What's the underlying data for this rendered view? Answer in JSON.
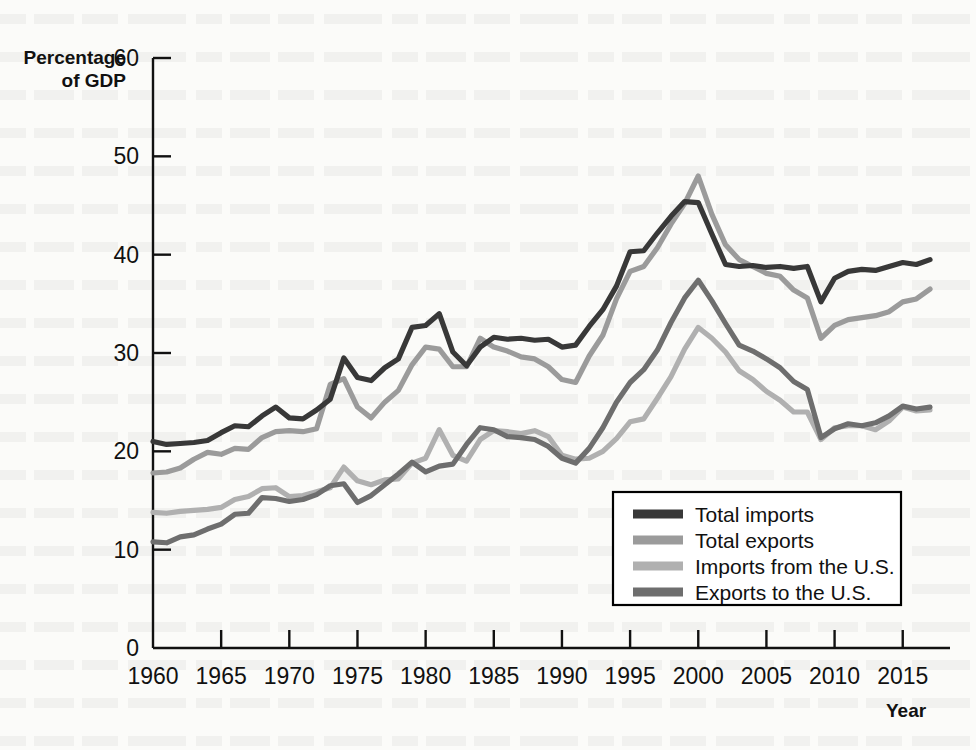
{
  "axes": {
    "y_title_line1": "Percentage",
    "y_title_line2": "of GDP",
    "x_title": "Year",
    "y_ticks": [
      "0",
      "10",
      "20",
      "30",
      "40",
      "50",
      "60"
    ],
    "x_ticks": [
      "1960",
      "1965",
      "1970",
      "1975",
      "1980",
      "1985",
      "1990",
      "1995",
      "2000",
      "2005",
      "2010",
      "2015"
    ]
  },
  "legend": {
    "items": [
      {
        "label": "Total imports",
        "color": "#383838"
      },
      {
        "label": "Total exports",
        "color": "#9b9b9b"
      },
      {
        "label": "Imports from the U.S.",
        "color": "#b0b0b0"
      },
      {
        "label": "Exports to the U.S.",
        "color": "#6e6e6e"
      }
    ]
  },
  "chart_data": {
    "type": "line",
    "title": "",
    "xlabel": "Year",
    "ylabel": "Percentage of GDP",
    "xlim": [
      1960,
      2017
    ],
    "ylim": [
      0,
      60
    ],
    "grid": false,
    "legend_position": "inside-bottom-right",
    "x": [
      1960,
      1961,
      1962,
      1963,
      1964,
      1965,
      1966,
      1967,
      1968,
      1969,
      1970,
      1971,
      1972,
      1973,
      1974,
      1975,
      1976,
      1977,
      1978,
      1979,
      1980,
      1981,
      1982,
      1983,
      1984,
      1985,
      1986,
      1987,
      1988,
      1989,
      1990,
      1991,
      1992,
      1993,
      1994,
      1995,
      1996,
      1997,
      1998,
      1999,
      2000,
      2001,
      2002,
      2003,
      2004,
      2005,
      2006,
      2007,
      2008,
      2009,
      2010,
      2011,
      2012,
      2013,
      2014,
      2015,
      2016,
      2017
    ],
    "series": [
      {
        "name": "Total imports",
        "color": "#383838",
        "values": [
          21.0,
          20.7,
          20.8,
          20.9,
          21.1,
          21.9,
          22.6,
          22.5,
          23.6,
          24.5,
          23.4,
          23.3,
          24.2,
          25.3,
          29.5,
          27.5,
          27.2,
          28.5,
          29.4,
          32.6,
          32.8,
          34.0,
          30.1,
          28.7,
          30.6,
          31.6,
          31.4,
          31.5,
          31.3,
          31.4,
          30.6,
          30.8,
          32.7,
          34.4,
          36.8,
          40.3,
          40.4,
          42.2,
          43.9,
          45.4,
          45.3,
          42.1,
          39.0,
          38.8,
          38.9,
          38.7,
          38.8,
          38.6,
          38.8,
          35.2,
          37.6,
          38.3,
          38.5,
          38.4,
          38.8,
          39.2,
          39.0,
          39.5
        ]
      },
      {
        "name": "Total exports",
        "color": "#9b9b9b",
        "values": [
          17.8,
          17.9,
          18.3,
          19.2,
          19.9,
          19.7,
          20.3,
          20.2,
          21.4,
          22.0,
          22.1,
          22.0,
          22.3,
          26.8,
          27.4,
          24.5,
          23.4,
          25.0,
          26.2,
          28.8,
          30.6,
          30.4,
          28.6,
          28.6,
          31.5,
          30.6,
          30.2,
          29.6,
          29.4,
          28.6,
          27.3,
          27.0,
          29.7,
          31.8,
          35.5,
          38.3,
          38.8,
          40.7,
          43.1,
          45.2,
          48.0,
          44.1,
          41.0,
          39.5,
          38.8,
          38.1,
          37.8,
          36.4,
          35.6,
          31.5,
          32.8,
          33.4,
          33.6,
          33.8,
          34.2,
          35.2,
          35.5,
          36.5
        ]
      },
      {
        "name": "Imports from the U.S.",
        "color": "#b0b0b0",
        "values": [
          13.8,
          13.7,
          13.9,
          14.0,
          14.1,
          14.3,
          15.1,
          15.4,
          16.2,
          16.3,
          15.4,
          15.5,
          15.9,
          16.3,
          18.4,
          17.0,
          16.6,
          17.1,
          17.2,
          18.8,
          19.3,
          22.2,
          19.6,
          19.0,
          21.2,
          22.1,
          22.0,
          21.8,
          22.1,
          21.5,
          19.6,
          19.2,
          19.3,
          20.0,
          21.3,
          23.0,
          23.3,
          25.4,
          27.6,
          30.4,
          32.6,
          31.5,
          30.1,
          28.2,
          27.3,
          26.1,
          25.2,
          24.0,
          24.0,
          21.2,
          22.4,
          22.6,
          22.6,
          22.2,
          23.1,
          24.5,
          24.1,
          24.2
        ]
      },
      {
        "name": "Exports to the U.S.",
        "color": "#6e6e6e",
        "values": [
          10.8,
          10.7,
          11.3,
          11.5,
          12.1,
          12.6,
          13.6,
          13.7,
          15.3,
          15.2,
          14.9,
          15.1,
          15.6,
          16.5,
          16.7,
          14.8,
          15.5,
          16.6,
          17.7,
          18.9,
          17.9,
          18.5,
          18.7,
          20.7,
          22.4,
          22.2,
          21.5,
          21.4,
          21.2,
          20.5,
          19.3,
          18.8,
          20.3,
          22.4,
          25.0,
          27.0,
          28.3,
          30.3,
          33.1,
          35.6,
          37.4,
          35.3,
          33.0,
          30.8,
          30.2,
          29.4,
          28.5,
          27.1,
          26.3,
          21.4,
          22.3,
          22.8,
          22.6,
          22.9,
          23.6,
          24.6,
          24.3,
          24.5
        ]
      }
    ]
  }
}
